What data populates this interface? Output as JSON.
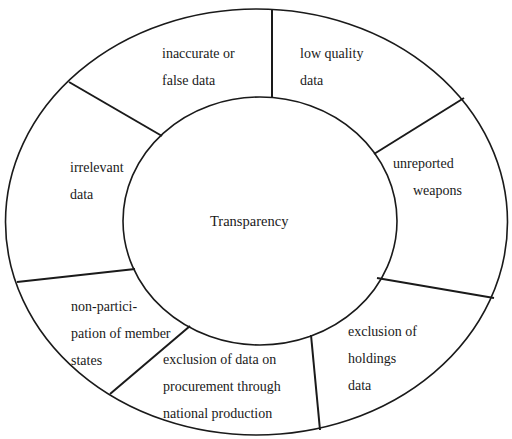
{
  "diagram": {
    "center": {
      "label": "Transparency"
    },
    "segments": [
      {
        "id": "inaccurate",
        "lines": [
          "inaccurate or",
          "false data"
        ]
      },
      {
        "id": "low-quality",
        "lines": [
          "low quality",
          "data"
        ]
      },
      {
        "id": "unreported",
        "lines": [
          "unreported",
          "weapons"
        ]
      },
      {
        "id": "holdings",
        "lines": [
          "exclusion of",
          "holdings",
          "data"
        ]
      },
      {
        "id": "procurement",
        "lines": [
          "exclusion of data on",
          "procurement through",
          "national production"
        ]
      },
      {
        "id": "non-participation",
        "lines": [
          "non-partici-",
          "pation of member",
          "states"
        ]
      },
      {
        "id": "irrelevant",
        "lines": [
          "irrelevant",
          "data"
        ]
      }
    ],
    "colors": {
      "line": "#1a1a1a",
      "background": "#ffffff",
      "text": "#1a1a1a"
    }
  }
}
